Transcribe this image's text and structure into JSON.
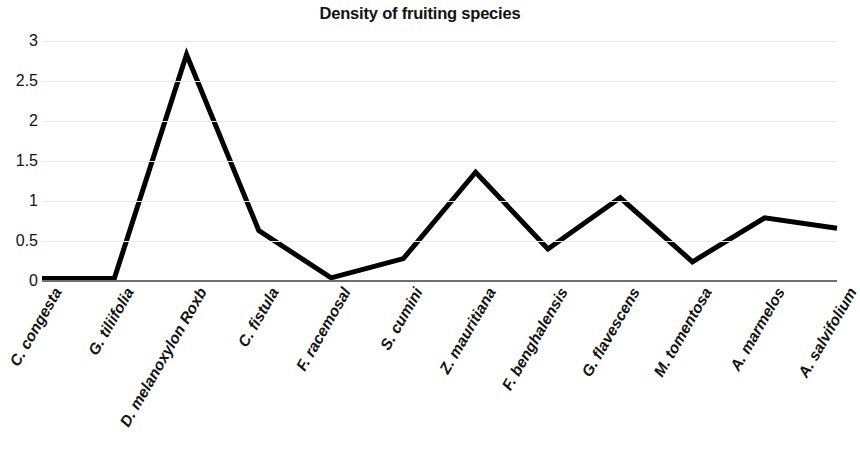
{
  "chart_data": {
    "type": "line",
    "title": "Density of fruiting species",
    "xlabel": "",
    "ylabel": "",
    "ylim": [
      0,
      3
    ],
    "yticks": [
      "0",
      "0.5",
      "1",
      "1.5",
      "2",
      "2.5",
      "3"
    ],
    "ytick_values": [
      0,
      0.5,
      1,
      1.5,
      2,
      2.5,
      3
    ],
    "grid": true,
    "legend": "none",
    "line_color": "#000000",
    "line_width": 5,
    "categories": [
      "C. congesta",
      "G. tiliifolia",
      "D. melanoxylon Roxb",
      "C. fistula",
      "F. racemosal",
      "S. cumini",
      "Z. mauritiana",
      "F. benghalensis",
      "G. flavescens",
      "M. tomentosa",
      "A. marmelos",
      "A. salvifolium"
    ],
    "values": [
      0.03,
      0.03,
      2.83,
      0.63,
      0.04,
      0.28,
      1.36,
      0.4,
      1.04,
      0.24,
      0.79,
      0.66
    ]
  }
}
